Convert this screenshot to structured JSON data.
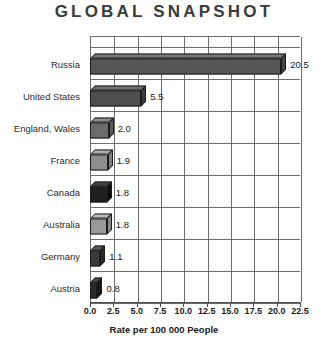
{
  "title": "GLOBAL SNAPSHOT",
  "chart_data": {
    "type": "bar",
    "orientation": "horizontal",
    "title": "GLOBAL SNAPSHOT",
    "xlabel": "Rate per 100 000 People",
    "ylabel": "",
    "xlim": [
      0,
      22.5
    ],
    "xticks": [
      "0.0",
      "2.5",
      "5.0",
      "7.5",
      "10.0",
      "12.5",
      "15.0",
      "17.5",
      "20.0",
      "22.5"
    ],
    "grid": true,
    "legend": "none",
    "categories": [
      "Russia",
      "United States",
      "England, Wales",
      "France",
      "Canada",
      "Australia",
      "Germany",
      "Austria"
    ],
    "values": [
      20.5,
      5.5,
      2.0,
      1.9,
      1.8,
      1.8,
      1.1,
      0.8
    ],
    "value_labels": [
      "20.5",
      "5.5",
      "2.0",
      "1.9",
      "1.8",
      "1.8",
      "1.1",
      "0.8"
    ],
    "bar_colors": [
      "#565656",
      "#4e4e4e",
      "#6b6b6b",
      "#8e8e8e",
      "#1f1f1f",
      "#9a9a9a",
      "#3a3a3a",
      "#2a2a2a"
    ]
  },
  "colors": {
    "grid": "#6d6d6d",
    "axis": "#4a4a4a",
    "text": "#1a1a1a",
    "title": "#3b3b3b"
  }
}
